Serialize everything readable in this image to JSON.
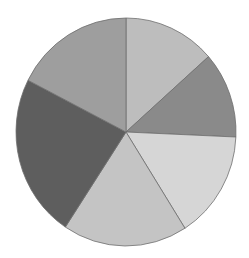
{
  "chart_data": {
    "type": "pie",
    "title": "",
    "labels": [
      "",
      "",
      "",
      "",
      "",
      ""
    ],
    "values": [
      13.5,
      12.2,
      15.3,
      18.3,
      23.2,
      17.5
    ],
    "colors": [
      "#bdbdbd",
      "#8a8a8a",
      "#d6d6d6",
      "#c4c4c4",
      "#5e5e5e",
      "#9e9e9e"
    ],
    "start_angle_deg": -90,
    "direction": "clockwise",
    "legend": false,
    "center": [
      126,
      132
    ],
    "radius": [
      110,
      114
    ],
    "stroke_color": "#6e6e6e"
  }
}
